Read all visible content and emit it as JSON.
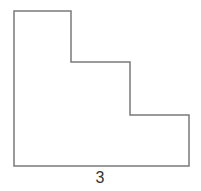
{
  "diagram": {
    "type": "rectilinear-staircase-polygon",
    "stroke_color": "#7a7a7a",
    "fill_color": "#ffffff",
    "vertices": [
      [
        14,
        11
      ],
      [
        71,
        11
      ],
      [
        71,
        62
      ],
      [
        130,
        62
      ],
      [
        130,
        115
      ],
      [
        189,
        115
      ],
      [
        189,
        166
      ],
      [
        14,
        166
      ]
    ],
    "labels": {
      "bottom_side": "3"
    }
  }
}
